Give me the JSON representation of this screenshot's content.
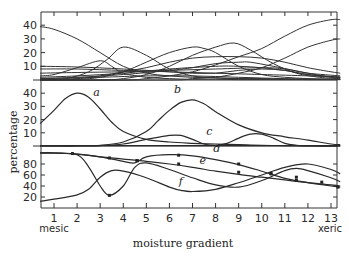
{
  "chart_data": {
    "type": "line",
    "title": "",
    "xlabel": "moisture gradient",
    "ylabel": "percentage",
    "x_ticks": [
      1,
      2,
      3,
      4,
      5,
      6,
      7,
      8,
      9,
      10,
      11,
      12,
      13
    ],
    "x_annotations": {
      "left": "mesic",
      "right": "xeric"
    },
    "xlim": [
      0.4,
      13.4
    ],
    "panels": [
      {
        "name": "top",
        "ylim": [
          0,
          45
        ],
        "y_ticks": [
          10,
          20,
          30,
          40
        ],
        "series": [
          {
            "name": "t1",
            "x": [
              0.4,
              1,
              2,
              3,
              4,
              5,
              6,
              7,
              8,
              9,
              10,
              11,
              12,
              13,
              13.4
            ],
            "y": [
              39,
              37,
              30,
              20,
              10,
              5,
              3,
              2,
              1.5,
              1,
              1,
              0.5,
              0.5,
              0.5,
              0.5
            ]
          },
          {
            "name": "t2",
            "x": [
              0.4,
              1.5,
              2.5,
              3.3,
              4,
              5,
              6,
              7,
              8,
              9,
              10,
              11,
              12,
              13,
              13.4
            ],
            "y": [
              0,
              1,
              6,
              15,
              24,
              18,
              8,
              3,
              1.5,
              1,
              0.5,
              0.5,
              0.3,
              0.3,
              0.3
            ]
          },
          {
            "name": "t3",
            "x": [
              0.4,
              1,
              2,
              3,
              3.5,
              4,
              5,
              6,
              7,
              8,
              9,
              10,
              11,
              12,
              13,
              13.4
            ],
            "y": [
              3,
              4,
              9,
              14,
              10,
              5,
              2,
              1,
              0.5,
              0.5,
              0.3,
              0.3,
              0.3,
              0.3,
              0.3,
              0.3
            ]
          },
          {
            "name": "t4",
            "x": [
              0.4,
              2,
              3,
              4,
              5,
              6,
              7,
              7.5,
              8,
              9,
              10,
              11,
              12,
              13,
              13.4
            ],
            "y": [
              0,
              0.5,
              2,
              6,
              13,
              20,
              24,
              23,
              20,
              10,
              4,
              2,
              1,
              0.5,
              0.5
            ]
          },
          {
            "name": "t5",
            "x": [
              0.4,
              2,
              3,
              4,
              5,
              6,
              7,
              8,
              9,
              10,
              11,
              12,
              13,
              13.4
            ],
            "y": [
              0.5,
              1,
              3,
              6,
              9,
              13,
              16,
              17,
              17,
              16,
              13,
              9,
              6,
              5
            ]
          },
          {
            "name": "t6",
            "x": [
              0.4,
              3,
              4,
              5,
              6,
              7,
              8,
              8.8,
              9.5,
              10.5,
              11.5,
              12.5,
              13.4
            ],
            "y": [
              0,
              0,
              1,
              4,
              10,
              18,
              24,
              27,
              22,
              12,
              5,
              2,
              1
            ]
          },
          {
            "name": "t7",
            "x": [
              0.4,
              4,
              5,
              6,
              7,
              8,
              9,
              10,
              11,
              12,
              13,
              13.4
            ],
            "y": [
              0,
              0,
              1,
              3,
              6,
              11,
              17,
              23,
              32,
              40,
              44,
              44
            ]
          },
          {
            "name": "t8",
            "x": [
              0.4,
              6,
              7,
              8,
              9,
              10,
              11,
              12,
              13,
              13.4
            ],
            "y": [
              0,
              0,
              1,
              2,
              5,
              9,
              16,
              24,
              29,
              30
            ]
          },
          {
            "name": "t9",
            "x": [
              0.4,
              2,
              4,
              6,
              7,
              8,
              9,
              9.5,
              10.5,
              12,
              13,
              13.4
            ],
            "y": [
              1,
              2,
              4,
              7,
              9,
              12,
              13,
              13,
              10,
              5,
              2,
              2
            ]
          },
          {
            "name": "t10",
            "x": [
              0.4,
              2,
              4,
              6,
              7,
              8,
              9,
              10,
              11,
              12,
              13.4
            ],
            "y": [
              10,
              9.5,
              8,
              6,
              5,
              5,
              7,
              8,
              7,
              4,
              2
            ]
          },
          {
            "name": "t11",
            "x": [
              0.4,
              2,
              4,
              6,
              8,
              10,
              12,
              13.4
            ],
            "y": [
              8,
              8,
              7,
              6,
              5,
              4,
              3,
              2
            ]
          },
          {
            "name": "t12",
            "x": [
              0.4,
              2,
              4,
              6,
              8,
              10,
              11,
              12,
              13.4
            ],
            "y": [
              5,
              5.5,
              6,
              7,
              8,
              9,
              8,
              5,
              3
            ]
          },
          {
            "name": "t13",
            "x": [
              0.4,
              2,
              4,
              6,
              8,
              9,
              10,
              11,
              12,
              13.4
            ],
            "y": [
              2,
              3,
              5,
              8,
              10,
              10,
              9,
              7,
              4,
              2
            ]
          },
          {
            "name": "t14",
            "x": [
              0.4,
              3,
              5,
              7,
              9,
              11,
              13.4
            ],
            "y": [
              1,
              2,
              3,
              3,
              2,
              1,
              0.5
            ]
          }
        ]
      },
      {
        "name": "middle",
        "ylim": [
          0,
          45
        ],
        "y_ticks": [
          10,
          20,
          30,
          40
        ],
        "series": [
          {
            "name": "a",
            "label_pos": [
              2.7,
              38
            ],
            "x": [
              0.4,
              1,
              1.5,
              2,
              2.5,
              3,
              3.5,
              4,
              5,
              6,
              7,
              8,
              9,
              10,
              11,
              12,
              13,
              13.4
            ],
            "y": [
              17,
              27,
              36,
              40,
              37,
              28,
              18,
              11,
              5,
              3,
              2,
              1.5,
              1,
              0.5,
              0.3,
              0.2,
              0.1,
              0.1
            ]
          },
          {
            "name": "b",
            "label_pos": [
              6.2,
              40
            ],
            "x": [
              0.4,
              1,
              2,
              3,
              4,
              5,
              5.5,
              6,
              6.5,
              7,
              7.5,
              8,
              9,
              10,
              11,
              12,
              13,
              13.4
            ],
            "y": [
              0,
              0,
              0.2,
              0.5,
              3,
              11,
              19,
              27,
              33,
              35,
              32,
              26,
              16,
              10,
              7,
              4.5,
              1.5,
              1
            ]
          },
          {
            "name": "c",
            "label_pos": [
              7.6,
              8
            ],
            "x": [
              0.4,
              1,
              2,
              3,
              4,
              5,
              6,
              6.5,
              7,
              7.5,
              8,
              8.5,
              9,
              9.5,
              10,
              10.5,
              11,
              11.5,
              12,
              13.4
            ],
            "y": [
              0,
              0,
              0,
              0.3,
              1.5,
              5,
              8,
              8,
              5,
              1.5,
              0.5,
              2,
              6,
              9,
              9,
              6,
              2,
              0.5,
              0,
              0
            ]
          },
          {
            "name": "base",
            "x": [
              0.4,
              13.4
            ],
            "y": [
              0.2,
              0.2
            ]
          }
        ]
      },
      {
        "name": "bottom",
        "ylim": [
          0,
          100
        ],
        "y_ticks": [
          20,
          40,
          60,
          80
        ],
        "series": [
          {
            "name": "d",
            "label_pos": [
              7.9,
              101
            ],
            "x": [
              0.4,
              1,
              2,
              3,
              4,
              4.5,
              5,
              6,
              7,
              8,
              9,
              10,
              11,
              12,
              13,
              13.4
            ],
            "y": [
              100,
              100,
              98,
              93,
              85,
              82,
              93,
              97,
              95,
              88,
              79,
              67,
              54,
              46,
              40,
              38
            ],
            "markers": [
              [
                4.6,
                86
              ],
              [
                6.4,
                96
              ],
              [
                9.0,
                80
              ],
              [
                10.4,
                63
              ],
              [
                11.5,
                56
              ],
              [
                13.3,
                38
              ]
            ]
          },
          {
            "name": "e",
            "label_pos": [
              7.3,
              80
            ],
            "x": [
              0.4,
              1,
              2,
              3,
              4,
              5,
              6,
              7,
              8,
              9,
              10,
              11,
              12,
              13,
              13.4
            ],
            "y": [
              100,
              100,
              98,
              93,
              89,
              85,
              80,
              74,
              67,
              61,
              56,
              51,
              46,
              42,
              40
            ],
            "markers": [
              [
                1.8,
                99
              ],
              [
                3.4,
                91
              ],
              [
                4.6,
                86
              ],
              [
                6.4,
                80
              ],
              [
                9.0,
                65
              ],
              [
                10.4,
                62
              ],
              [
                11.5,
                50
              ],
              [
                12.6,
                47
              ]
            ]
          },
          {
            "name": "f",
            "label_pos": [
              6.4,
              42
            ],
            "x": [
              0.4,
              1,
              2,
              2.5,
              3,
              3.4,
              4,
              4.5,
              5,
              6,
              7,
              8,
              9,
              10,
              11,
              11.5,
              12,
              13,
              13.4
            ],
            "y": [
              100,
              100,
              97,
              75,
              40,
              23,
              40,
              74,
              82,
              70,
              55,
              42,
              38,
              50,
              68,
              72,
              68,
              55,
              48
            ],
            "markers": [
              [
                3.4,
                23
              ]
            ]
          },
          {
            "name": "g",
            "x": [
              0.4,
              1,
              2,
              2.5,
              3,
              3.5,
              4,
              5,
              6,
              6.5,
              7,
              8,
              9,
              10,
              11,
              12,
              13,
              13.4
            ],
            "y": [
              12,
              16,
              24,
              34,
              56,
              68,
              67,
              55,
              38,
              32,
              30,
              34,
              46,
              60,
              74,
              80,
              70,
              62
            ]
          }
        ]
      }
    ]
  }
}
